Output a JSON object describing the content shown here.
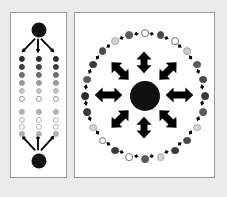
{
  "figure": {
    "title": "",
    "background_color": "#ebebeb",
    "panel_background": "#ffffff",
    "panel_border_color": "#9a9a9a",
    "width": 227,
    "height": 197
  },
  "palette": {
    "black": "#111111",
    "dark": "#2d2d2d",
    "dark_gray": "#5a5a5a",
    "mid_gray": "#8c8c8c",
    "light_gray": "#b8b8b8",
    "pale_gray": "#d8d8d8",
    "white_fill": "#ffffff",
    "outline": "#6e6e6e",
    "arrow": "#000000"
  },
  "panels": [
    {
      "id": "panel-a",
      "name": "hierarchical-panel",
      "label": "",
      "x": 10,
      "y": 12,
      "width": 57,
      "height": 166,
      "hubs": [
        {
          "name": "top-hub",
          "cx": 28,
          "cy": 17,
          "r": 7.5,
          "fill": "#111111"
        },
        {
          "name": "bottom-hub",
          "cx": 28,
          "cy": 148,
          "r": 7.5,
          "fill": "#111111"
        }
      ],
      "arrows": [
        {
          "name": "top-hub-arrow-left",
          "x1": 25,
          "y1": 26,
          "x2": 11,
          "y2": 40,
          "head": "end",
          "width": 1.9
        },
        {
          "name": "top-hub-arrow-center",
          "x1": 28,
          "y1": 26,
          "x2": 28,
          "y2": 41,
          "head": "end",
          "width": 1.9
        },
        {
          "name": "top-hub-arrow-right",
          "x1": 31,
          "y1": 26,
          "x2": 45,
          "y2": 40,
          "head": "end",
          "width": 1.9
        },
        {
          "name": "bottom-hub-arrow-left",
          "x1": 25,
          "y1": 139,
          "x2": 11,
          "y2": 124,
          "head": "end",
          "width": 1.9
        },
        {
          "name": "bottom-hub-arrow-center",
          "x1": 28,
          "y1": 139,
          "x2": 28,
          "y2": 123,
          "head": "end",
          "width": 1.9
        },
        {
          "name": "bottom-hub-arrow-right",
          "x1": 31,
          "y1": 139,
          "x2": 45,
          "y2": 124,
          "head": "end",
          "width": 1.9
        }
      ],
      "grids": [
        {
          "name": "upper-gradient-grid",
          "columns_x": [
            11,
            28,
            45
          ],
          "rows_y": [
            46,
            54,
            62,
            70,
            78,
            86
          ],
          "radius": 3.1,
          "row_fills": [
            "#2d2d2d",
            "#3f3f3f",
            "#6e6e6e",
            "#9a9a9a",
            "#bfbfbf",
            "#ffffff"
          ],
          "row_strokes": [
            "#2d2d2d",
            "#3f3f3f",
            "#6e6e6e",
            "#9a9a9a",
            "#bfbfbf",
            "#999999"
          ]
        },
        {
          "name": "lower-gradient-grid",
          "columns_x": [
            11,
            28,
            45
          ],
          "rows_y": [
            99,
            107,
            114,
            121
          ],
          "radius": 3.1,
          "row_fills": [
            "#b0b0b0",
            "#ffffff",
            "#ffffff",
            "#b0b0b0"
          ],
          "row_strokes": [
            "#b0b0b0",
            "#b4b4b4",
            "#b4b4b4",
            "#b0b0b0"
          ]
        }
      ]
    },
    {
      "id": "panel-b",
      "name": "radial-network-panel",
      "label": "",
      "x": 74,
      "y": 12,
      "width": 141,
      "height": 166,
      "hub": {
        "name": "central-hub",
        "cx": 70,
        "cy": 83,
        "r": 15,
        "fill": "#111111"
      },
      "radial_arrows": {
        "name": "radial-double-arrows",
        "count": 8,
        "inner_radius_x": 22,
        "inner_radius_y": 22,
        "outer_radius_x": 50,
        "outer_radius_y": 44,
        "width": 7,
        "head_size": 8,
        "angles_deg": [
          0,
          45,
          90,
          135,
          180,
          225,
          270,
          315
        ],
        "double_headed": true
      },
      "ring": {
        "name": "peripheral-ring",
        "center_x": 70,
        "center_y": 83,
        "radius_x": 60,
        "radius_y": 63,
        "node_radius": 3.9,
        "connector": "double-arrow",
        "nodes": [
          {
            "angle": 270,
            "fill": "#ffffff",
            "stroke": "#6e6e6e"
          },
          {
            "angle": 285,
            "fill": "#4a4a4a",
            "stroke": "#4a4a4a"
          },
          {
            "angle": 300,
            "fill": "#ffffff",
            "stroke": "#6e6e6e"
          },
          {
            "angle": 315,
            "fill": "#c9c9c9",
            "stroke": "#a8a8a8"
          },
          {
            "angle": 330,
            "fill": "#5a5a5a",
            "stroke": "#5a5a5a"
          },
          {
            "angle": 345,
            "fill": "#4a4a4a",
            "stroke": "#4a4a4a"
          },
          {
            "angle": 0,
            "fill": "#3a3a3a",
            "stroke": "#3a3a3a"
          },
          {
            "angle": 15,
            "fill": "#5a5a5a",
            "stroke": "#5a5a5a"
          },
          {
            "angle": 30,
            "fill": "#d4d4d4",
            "stroke": "#a8a8a8"
          },
          {
            "angle": 45,
            "fill": "#4a4a4a",
            "stroke": "#4a4a4a"
          },
          {
            "angle": 60,
            "fill": "#3a3a3a",
            "stroke": "#3a3a3a"
          },
          {
            "angle": 75,
            "fill": "#d4d4d4",
            "stroke": "#a8a8a8"
          },
          {
            "angle": 90,
            "fill": "#5a5a5a",
            "stroke": "#5a5a5a"
          },
          {
            "angle": 105,
            "fill": "#ffffff",
            "stroke": "#6e6e6e"
          },
          {
            "angle": 120,
            "fill": "#3a3a3a",
            "stroke": "#3a3a3a"
          },
          {
            "angle": 135,
            "fill": "#ffffff",
            "stroke": "#6e6e6e"
          },
          {
            "angle": 150,
            "fill": "#d4d4d4",
            "stroke": "#a8a8a8"
          },
          {
            "angle": 165,
            "fill": "#3a3a3a",
            "stroke": "#3a3a3a"
          },
          {
            "angle": 180,
            "fill": "#2d2d2d",
            "stroke": "#2d2d2d"
          },
          {
            "angle": 195,
            "fill": "#5a5a5a",
            "stroke": "#5a5a5a"
          },
          {
            "angle": 210,
            "fill": "#3a3a3a",
            "stroke": "#3a3a3a"
          },
          {
            "angle": 225,
            "fill": "#4a4a4a",
            "stroke": "#4a4a4a"
          },
          {
            "angle": 240,
            "fill": "#d4d4d4",
            "stroke": "#a8a8a8"
          },
          {
            "angle": 255,
            "fill": "#5a5a5a",
            "stroke": "#5a5a5a"
          }
        ]
      }
    }
  ]
}
